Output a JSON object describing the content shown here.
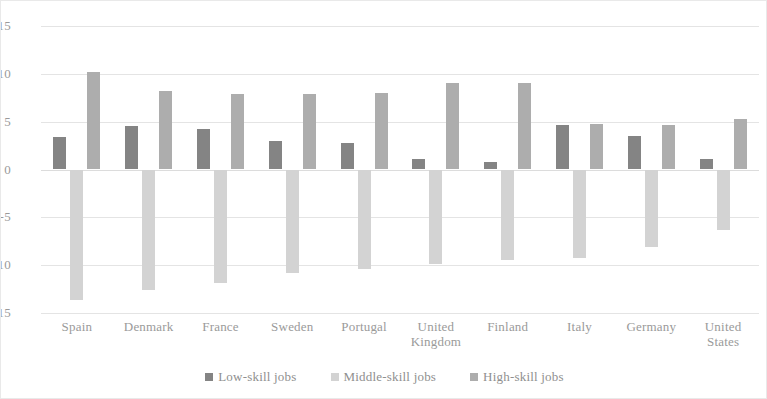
{
  "chart_data": {
    "type": "bar",
    "title": "",
    "subtitle": "",
    "xlabel": "",
    "ylabel": "",
    "ylim": [
      -15,
      15
    ],
    "yticks": [
      15,
      10,
      5,
      0,
      -5,
      -10,
      -15
    ],
    "ytick_labels": [
      "15",
      "10",
      "5",
      "0",
      "-5",
      "-10",
      "-15"
    ],
    "grid": true,
    "legend_position": "bottom",
    "categories": [
      "Spain",
      "Denmark",
      "France",
      "Sweden",
      "Portugal",
      "United Kingdom",
      "Finland",
      "Italy",
      "Germany",
      "United States"
    ],
    "category_lines": [
      [
        "Spain"
      ],
      [
        "Denmark"
      ],
      [
        "France"
      ],
      [
        "Sweden"
      ],
      [
        "Portugal"
      ],
      [
        "United",
        "Kingdom"
      ],
      [
        "Finland"
      ],
      [
        "Italy"
      ],
      [
        "Germany"
      ],
      [
        "United",
        "States"
      ]
    ],
    "series": [
      {
        "name": "Low-skill jobs",
        "color": "#848484",
        "values": [
          3.4,
          4.5,
          4.2,
          3.0,
          2.8,
          1.1,
          0.8,
          4.7,
          3.5,
          1.1
        ]
      },
      {
        "name": "Middle-skill jobs",
        "color": "#d3d3d3",
        "values": [
          -13.6,
          -12.6,
          -11.9,
          -10.8,
          -10.4,
          -9.9,
          -9.5,
          -9.3,
          -8.1,
          -6.3
        ]
      },
      {
        "name": "High-skill jobs",
        "color": "#adadad",
        "values": [
          10.2,
          8.2,
          7.9,
          7.9,
          8.0,
          9.0,
          9.0,
          4.8,
          4.7,
          5.3
        ]
      }
    ]
  },
  "legend": {
    "items": [
      {
        "label": "Low-skill jobs",
        "color": "#848484"
      },
      {
        "label": "Middle-skill jobs",
        "color": "#d3d3d3"
      },
      {
        "label": "High-skill jobs",
        "color": "#adadad"
      }
    ]
  }
}
